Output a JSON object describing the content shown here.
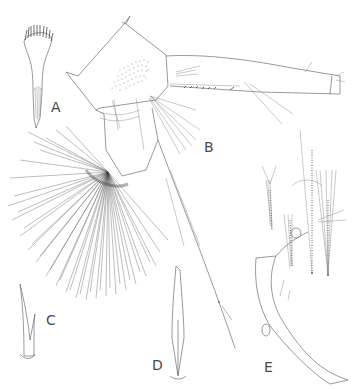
{
  "figure": {
    "type": "scientific line illustration",
    "panels": [
      {
        "id": "A",
        "label": "A",
        "description": "fan-tipped seta / brush structure"
      },
      {
        "id": "B",
        "label": "B",
        "description": "appendage with basal segment, setal fan, and elongate ramus"
      },
      {
        "id": "C",
        "label": "C",
        "description": "bifid spine"
      },
      {
        "id": "D",
        "label": "D",
        "description": "bifid spine (variant)"
      },
      {
        "id": "E",
        "label": "E",
        "description": "terminal segment with plumose setae"
      }
    ],
    "signature": "illustrator signature (small, illegible)"
  }
}
